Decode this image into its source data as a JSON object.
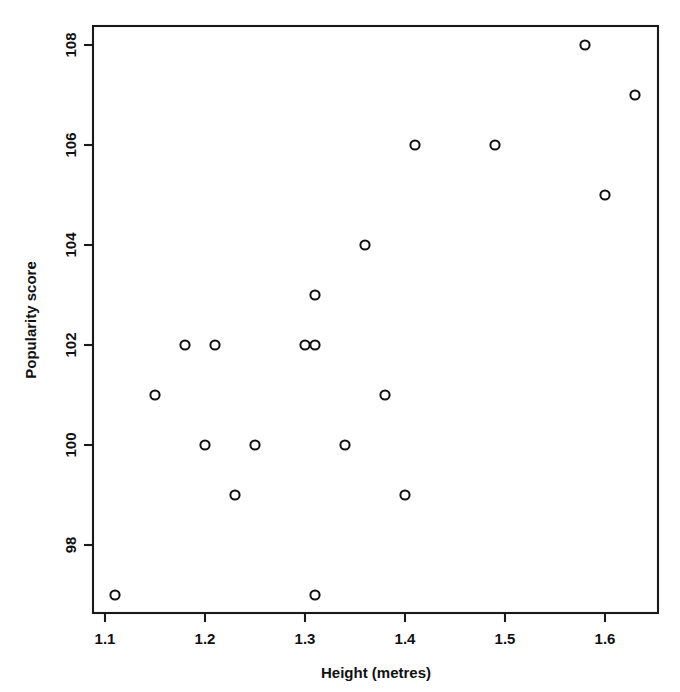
{
  "chart_data": {
    "type": "scatter",
    "title": "",
    "xlabel": "Height (metres)",
    "ylabel": "Popularity score",
    "xlim": [
      1.085,
      1.655
    ],
    "ylim": [
      96.45,
      108.55
    ],
    "grid": false,
    "legend": null,
    "xticks": [
      "1.1",
      "1.2",
      "1.3",
      "1.4",
      "1.5",
      "1.6"
    ],
    "xtick_values": [
      1.1,
      1.2,
      1.3,
      1.4,
      1.5,
      1.6
    ],
    "yticks": [
      "98",
      "100",
      "102",
      "104",
      "106",
      "108"
    ],
    "ytick_values": [
      98,
      100,
      102,
      104,
      106,
      108
    ],
    "marker": "open-circle",
    "marker_color": "#111111",
    "points": [
      {
        "x": 1.11,
        "y": 97
      },
      {
        "x": 1.15,
        "y": 101
      },
      {
        "x": 1.18,
        "y": 102
      },
      {
        "x": 1.2,
        "y": 100
      },
      {
        "x": 1.21,
        "y": 102
      },
      {
        "x": 1.23,
        "y": 99
      },
      {
        "x": 1.25,
        "y": 100
      },
      {
        "x": 1.3,
        "y": 102
      },
      {
        "x": 1.31,
        "y": 102
      },
      {
        "x": 1.31,
        "y": 103
      },
      {
        "x": 1.31,
        "y": 97
      },
      {
        "x": 1.34,
        "y": 100
      },
      {
        "x": 1.36,
        "y": 104
      },
      {
        "x": 1.38,
        "y": 101
      },
      {
        "x": 1.4,
        "y": 99
      },
      {
        "x": 1.41,
        "y": 106
      },
      {
        "x": 1.49,
        "y": 106
      },
      {
        "x": 1.58,
        "y": 108
      },
      {
        "x": 1.6,
        "y": 105
      },
      {
        "x": 1.63,
        "y": 107
      }
    ],
    "x_values": [
      1.11,
      1.15,
      1.18,
      1.2,
      1.21,
      1.23,
      1.25,
      1.3,
      1.31,
      1.31,
      1.31,
      1.34,
      1.36,
      1.38,
      1.4,
      1.41,
      1.49,
      1.58,
      1.6,
      1.63
    ],
    "y_values": [
      97,
      101,
      102,
      100,
      102,
      99,
      100,
      102,
      102,
      103,
      97,
      100,
      104,
      101,
      99,
      106,
      106,
      108,
      105,
      107
    ],
    "n_points": 20
  },
  "figure": {
    "background_color": "#ffffff",
    "foreground_color": "#111111"
  }
}
